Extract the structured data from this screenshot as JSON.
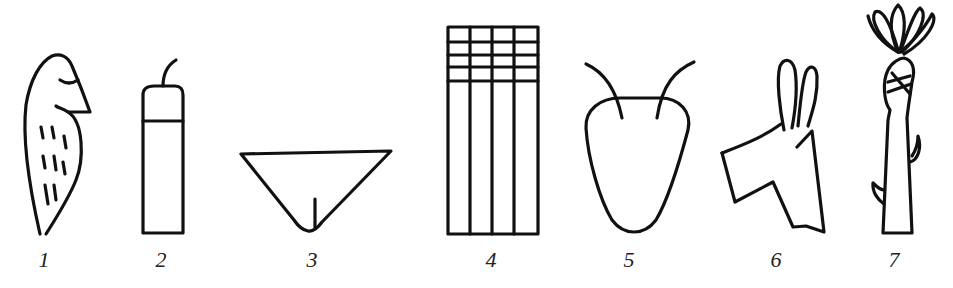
{
  "figure": {
    "glyphs": [
      {
        "number": "1",
        "subject": "bird"
      },
      {
        "number": "2",
        "subject": "vessel-with-spout"
      },
      {
        "number": "3",
        "subject": "pubic-triangle"
      },
      {
        "number": "4",
        "subject": "grid-field"
      },
      {
        "number": "5",
        "subject": "ox-head"
      },
      {
        "number": "6",
        "subject": "donkey-head"
      },
      {
        "number": "7",
        "subject": "plant-stalk"
      }
    ]
  },
  "colors": {
    "ink": "#111111",
    "background": "#ffffff"
  }
}
